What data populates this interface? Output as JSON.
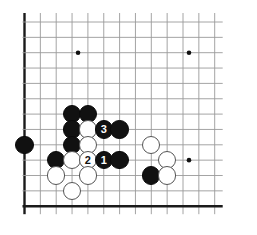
{
  "diagram": {
    "board": {
      "size": 19,
      "visible_columns": 13,
      "visible_rows": 13,
      "line_color": "#9a9a9a",
      "edge_color": "#1a1a1a",
      "background_color": "#ffffff",
      "star_point_color": "#111111",
      "origin_x": 24.5,
      "origin_y": 22.0,
      "spacing_x": 15.85,
      "spacing_y": 15.35,
      "stone_radius": 9.2
    },
    "star_points": [
      {
        "name": "star-point-top-left",
        "col": 4,
        "row": 3
      },
      {
        "name": "star-point-top-right",
        "col": 11,
        "row": 3
      },
      {
        "name": "star-point-right",
        "col": 11,
        "row": 10
      }
    ],
    "stones": [
      {
        "id": "b1",
        "color": "black",
        "col": 4,
        "row": 7,
        "label": ""
      },
      {
        "id": "b2",
        "color": "black",
        "col": 5,
        "row": 7,
        "label": ""
      },
      {
        "id": "b3",
        "color": "black",
        "col": 4,
        "row": 8,
        "label": ""
      },
      {
        "id": "w1",
        "color": "white",
        "col": 5,
        "row": 8,
        "label": ""
      },
      {
        "id": "b4",
        "color": "black",
        "col": 6,
        "row": 8,
        "label": "3"
      },
      {
        "id": "b5",
        "color": "black",
        "col": 7,
        "row": 8,
        "label": ""
      },
      {
        "id": "b6",
        "color": "black",
        "col": 4,
        "row": 9,
        "label": ""
      },
      {
        "id": "w2",
        "color": "white",
        "col": 5,
        "row": 9,
        "label": ""
      },
      {
        "id": "w3",
        "color": "white",
        "col": 9,
        "row": 9,
        "label": ""
      },
      {
        "id": "b7",
        "color": "black",
        "col": 1,
        "row": 9,
        "label": ""
      },
      {
        "id": "b8",
        "color": "black",
        "col": 3,
        "row": 10,
        "label": ""
      },
      {
        "id": "w4",
        "color": "white",
        "col": 4,
        "row": 10,
        "label": ""
      },
      {
        "id": "w5",
        "color": "white",
        "col": 5,
        "row": 10,
        "label": "2"
      },
      {
        "id": "b9",
        "color": "black",
        "col": 6,
        "row": 10,
        "label": "1"
      },
      {
        "id": "b10",
        "color": "black",
        "col": 7,
        "row": 10,
        "label": ""
      },
      {
        "id": "w6",
        "color": "white",
        "col": 10,
        "row": 10,
        "label": ""
      },
      {
        "id": "w7",
        "color": "white",
        "col": 3,
        "row": 11,
        "label": ""
      },
      {
        "id": "w8",
        "color": "white",
        "col": 5,
        "row": 11,
        "label": ""
      },
      {
        "id": "b11",
        "color": "black",
        "col": 9,
        "row": 11,
        "label": ""
      },
      {
        "id": "w9",
        "color": "white",
        "col": 10,
        "row": 11,
        "label": ""
      },
      {
        "id": "w10",
        "color": "white",
        "col": 4,
        "row": 12,
        "label": ""
      }
    ],
    "move_labels": [
      {
        "number": "1",
        "color": "black"
      },
      {
        "number": "2",
        "color": "white"
      },
      {
        "number": "3",
        "color": "black"
      }
    ]
  }
}
